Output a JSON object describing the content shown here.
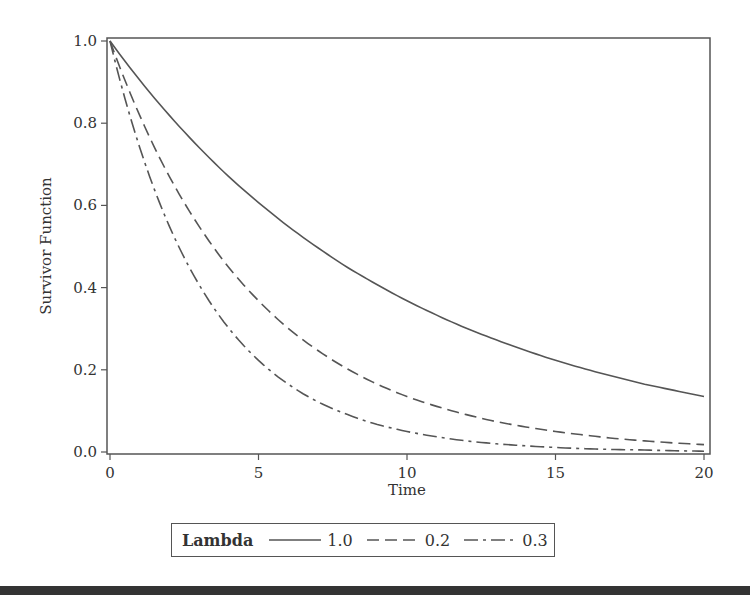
{
  "chart_data": {
    "type": "line",
    "title": "",
    "xlabel": "Time",
    "ylabel": "Survivor Function",
    "xlim": [
      0,
      20
    ],
    "ylim": [
      0,
      1.0
    ],
    "x_ticks": [
      "0",
      "5",
      "10",
      "15",
      "20"
    ],
    "y_ticks": [
      "0.0",
      "0.2",
      "0.4",
      "0.6",
      "0.8",
      "1.0"
    ],
    "grid": false,
    "legend": {
      "title": "Lambda",
      "position": "bottom",
      "entries": [
        "1.0",
        "0.2",
        "0.3"
      ]
    },
    "x": [
      0,
      1,
      2,
      3,
      4,
      5,
      6,
      7,
      8,
      9,
      10,
      11,
      12,
      13,
      14,
      15,
      16,
      17,
      18,
      19,
      20
    ],
    "series": [
      {
        "name": "1.0",
        "style": "solid",
        "values": [
          1.0,
          0.905,
          0.819,
          0.741,
          0.67,
          0.607,
          0.549,
          0.497,
          0.449,
          0.407,
          0.368,
          0.333,
          0.301,
          0.273,
          0.247,
          0.223,
          0.202,
          0.183,
          0.165,
          0.15,
          0.135
        ]
      },
      {
        "name": "0.2",
        "style": "dashed",
        "values": [
          1.0,
          0.819,
          0.67,
          0.549,
          0.449,
          0.368,
          0.301,
          0.247,
          0.202,
          0.165,
          0.135,
          0.111,
          0.091,
          0.074,
          0.061,
          0.05,
          0.041,
          0.033,
          0.027,
          0.022,
          0.018
        ]
      },
      {
        "name": "0.3",
        "style": "dash-dot",
        "values": [
          1.0,
          0.741,
          0.549,
          0.407,
          0.301,
          0.223,
          0.165,
          0.122,
          0.091,
          0.067,
          0.05,
          0.037,
          0.027,
          0.02,
          0.015,
          0.011,
          0.008,
          0.006,
          0.005,
          0.003,
          0.002
        ]
      }
    ]
  },
  "colors": {
    "line": "#555555",
    "frame": "#555555",
    "footer_bar": "#333333"
  }
}
